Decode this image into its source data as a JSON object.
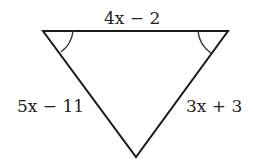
{
  "diagram": {
    "shape": "inverted-triangle",
    "vertices": {
      "top_left": [
        43,
        31
      ],
      "top_right": [
        228,
        31
      ],
      "bottom": [
        136,
        157
      ]
    },
    "labels": {
      "top_side": "4x − 2",
      "left_side": "5x − 11",
      "right_side": "3x + 3"
    },
    "angle_marks": [
      "top-left",
      "top-right"
    ],
    "stroke_color": "#1a1a1a"
  }
}
